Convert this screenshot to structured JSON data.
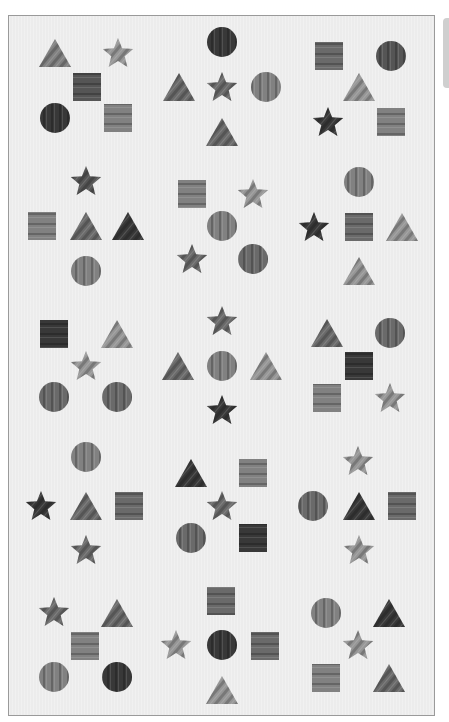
{
  "puzzle": {
    "tones": {
      "dark": "#383838",
      "mid-dark": "#555555",
      "mid": "#6a6a6a",
      "mid-light": "#818181",
      "light": "#969696"
    },
    "background": "#ececec",
    "cells": [
      {
        "row": 1,
        "col": 1,
        "shapes": [
          {
            "type": "triangle",
            "tone": "mid-light",
            "texture": "diagonal"
          },
          {
            "type": "star",
            "tone": "light",
            "texture": "diagonal"
          },
          {
            "type": "square",
            "tone": "mid-dark",
            "texture": "horizontal"
          },
          {
            "type": "circle",
            "tone": "dark",
            "texture": "vertical"
          },
          {
            "type": "square",
            "tone": "mid-light",
            "texture": "horizontal"
          }
        ]
      },
      {
        "row": 1,
        "col": 2,
        "shapes": [
          {
            "type": "circle",
            "tone": "dark",
            "texture": "vertical"
          },
          {
            "type": "triangle",
            "tone": "mid",
            "texture": "diagonal"
          },
          {
            "type": "star",
            "tone": "mid",
            "texture": "diagonal"
          },
          {
            "type": "circle",
            "tone": "mid-light",
            "texture": "vertical"
          },
          {
            "type": "triangle",
            "tone": "mid",
            "texture": "diagonal"
          }
        ]
      },
      {
        "row": 1,
        "col": 3,
        "shapes": [
          {
            "type": "square",
            "tone": "mid",
            "texture": "horizontal"
          },
          {
            "type": "circle",
            "tone": "mid-dark",
            "texture": "vertical"
          },
          {
            "type": "triangle",
            "tone": "light",
            "texture": "diagonal"
          },
          {
            "type": "star",
            "tone": "dark",
            "texture": "diagonal"
          },
          {
            "type": "square",
            "tone": "mid-light",
            "texture": "horizontal"
          }
        ]
      },
      {
        "row": 2,
        "col": 1,
        "shapes": [
          {
            "type": "star",
            "tone": "mid-dark",
            "texture": "diagonal"
          },
          {
            "type": "square",
            "tone": "mid-light",
            "texture": "horizontal"
          },
          {
            "type": "triangle",
            "tone": "mid",
            "texture": "diagonal"
          },
          {
            "type": "triangle",
            "tone": "dark",
            "texture": "diagonal"
          },
          {
            "type": "circle",
            "tone": "mid-light",
            "texture": "vertical"
          }
        ]
      },
      {
        "row": 2,
        "col": 2,
        "shapes": [
          {
            "type": "square",
            "tone": "mid-light",
            "texture": "horizontal"
          },
          {
            "type": "star",
            "tone": "light",
            "texture": "diagonal"
          },
          {
            "type": "circle",
            "tone": "mid-light",
            "texture": "vertical"
          },
          {
            "type": "star",
            "tone": "mid",
            "texture": "diagonal"
          },
          {
            "type": "circle",
            "tone": "mid",
            "texture": "vertical"
          }
        ]
      },
      {
        "row": 2,
        "col": 3,
        "shapes": [
          {
            "type": "circle",
            "tone": "mid-light",
            "texture": "vertical"
          },
          {
            "type": "star",
            "tone": "dark",
            "texture": "diagonal"
          },
          {
            "type": "square",
            "tone": "mid",
            "texture": "horizontal"
          },
          {
            "type": "triangle",
            "tone": "light",
            "texture": "diagonal"
          },
          {
            "type": "triangle",
            "tone": "light",
            "texture": "diagonal"
          }
        ]
      },
      {
        "row": 3,
        "col": 1,
        "shapes": [
          {
            "type": "square",
            "tone": "dark",
            "texture": "horizontal"
          },
          {
            "type": "triangle",
            "tone": "light",
            "texture": "diagonal"
          },
          {
            "type": "star",
            "tone": "light",
            "texture": "diagonal"
          },
          {
            "type": "circle",
            "tone": "mid",
            "texture": "vertical"
          },
          {
            "type": "circle",
            "tone": "mid",
            "texture": "vertical"
          }
        ]
      },
      {
        "row": 3,
        "col": 2,
        "shapes": [
          {
            "type": "star",
            "tone": "mid",
            "texture": "diagonal"
          },
          {
            "type": "triangle",
            "tone": "mid",
            "texture": "diagonal"
          },
          {
            "type": "circle",
            "tone": "mid-light",
            "texture": "vertical"
          },
          {
            "type": "triangle",
            "tone": "light",
            "texture": "diagonal"
          },
          {
            "type": "star",
            "tone": "dark",
            "texture": "diagonal"
          }
        ]
      },
      {
        "row": 3,
        "col": 3,
        "shapes": [
          {
            "type": "triangle",
            "tone": "mid",
            "texture": "diagonal"
          },
          {
            "type": "circle",
            "tone": "mid",
            "texture": "vertical"
          },
          {
            "type": "square",
            "tone": "dark",
            "texture": "horizontal"
          },
          {
            "type": "square",
            "tone": "mid-light",
            "texture": "horizontal"
          },
          {
            "type": "star",
            "tone": "light",
            "texture": "diagonal"
          }
        ]
      },
      {
        "row": 4,
        "col": 1,
        "shapes": [
          {
            "type": "circle",
            "tone": "mid-light",
            "texture": "vertical"
          },
          {
            "type": "star",
            "tone": "dark",
            "texture": "diagonal"
          },
          {
            "type": "triangle",
            "tone": "mid",
            "texture": "diagonal"
          },
          {
            "type": "square",
            "tone": "mid",
            "texture": "horizontal"
          },
          {
            "type": "star",
            "tone": "mid",
            "texture": "diagonal"
          }
        ]
      },
      {
        "row": 4,
        "col": 2,
        "shapes": [
          {
            "type": "triangle",
            "tone": "dark",
            "texture": "diagonal"
          },
          {
            "type": "square",
            "tone": "mid-light",
            "texture": "horizontal"
          },
          {
            "type": "star",
            "tone": "mid",
            "texture": "diagonal"
          },
          {
            "type": "circle",
            "tone": "mid",
            "texture": "vertical"
          },
          {
            "type": "square",
            "tone": "dark",
            "texture": "horizontal"
          }
        ]
      },
      {
        "row": 4,
        "col": 3,
        "shapes": [
          {
            "type": "star",
            "tone": "light",
            "texture": "diagonal"
          },
          {
            "type": "circle",
            "tone": "mid",
            "texture": "vertical"
          },
          {
            "type": "triangle",
            "tone": "dark",
            "texture": "diagonal"
          },
          {
            "type": "square",
            "tone": "mid",
            "texture": "horizontal"
          },
          {
            "type": "star",
            "tone": "light",
            "texture": "diagonal"
          }
        ]
      },
      {
        "row": 5,
        "col": 1,
        "shapes": [
          {
            "type": "star",
            "tone": "mid",
            "texture": "diagonal"
          },
          {
            "type": "triangle",
            "tone": "mid",
            "texture": "diagonal"
          },
          {
            "type": "square",
            "tone": "mid-light",
            "texture": "horizontal"
          },
          {
            "type": "circle",
            "tone": "mid-light",
            "texture": "vertical"
          },
          {
            "type": "circle",
            "tone": "dark",
            "texture": "vertical"
          }
        ]
      },
      {
        "row": 5,
        "col": 2,
        "shapes": [
          {
            "type": "square",
            "tone": "mid",
            "texture": "horizontal"
          },
          {
            "type": "star",
            "tone": "light",
            "texture": "diagonal"
          },
          {
            "type": "circle",
            "tone": "dark",
            "texture": "vertical"
          },
          {
            "type": "square",
            "tone": "mid",
            "texture": "horizontal"
          },
          {
            "type": "triangle",
            "tone": "light",
            "texture": "diagonal"
          }
        ]
      },
      {
        "row": 5,
        "col": 3,
        "shapes": [
          {
            "type": "circle",
            "tone": "mid-light",
            "texture": "vertical"
          },
          {
            "type": "triangle",
            "tone": "dark",
            "texture": "diagonal"
          },
          {
            "type": "star",
            "tone": "light",
            "texture": "diagonal"
          },
          {
            "type": "square",
            "tone": "mid-light",
            "texture": "horizontal"
          },
          {
            "type": "triangle",
            "tone": "mid",
            "texture": "diagonal"
          }
        ]
      }
    ]
  }
}
